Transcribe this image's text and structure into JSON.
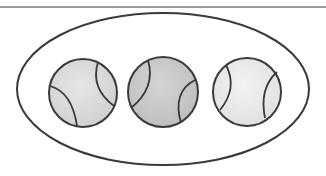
{
  "figure": {
    "description": "Three tennis balls enclosed in an oval (a set of three)",
    "divider": {
      "y": 7,
      "color": "#7a7a7a"
    },
    "oval": {
      "cx": 163,
      "cy": 89,
      "rx": 146,
      "ry": 76,
      "stroke": "#3a3a3a"
    },
    "balls": [
      {
        "label": "tennis ball 1",
        "cx": 83,
        "cy": 93,
        "r": 34,
        "fill": "#d9d9d9"
      },
      {
        "label": "tennis ball 2",
        "cx": 163,
        "cy": 92,
        "r": 35,
        "fill": "#c8c8c8"
      },
      {
        "label": "tennis ball 3",
        "cx": 247,
        "cy": 92,
        "r": 34,
        "fill": "#e8e8e8"
      }
    ],
    "stroke_color": "#3a3a3a"
  }
}
